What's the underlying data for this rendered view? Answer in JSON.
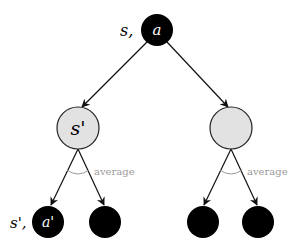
{
  "diagram": {
    "type": "expectimax-tree",
    "colors": {
      "action_node": "#000000",
      "state_node_fill": "#e2e2e2",
      "state_node_stroke": "#222222",
      "edge": "#111111",
      "average_label": "#9a9a9a"
    },
    "root": {
      "prefix_label": "s,",
      "node_label": "a"
    },
    "state_nodes": [
      {
        "label": "s'",
        "average_label": "average"
      },
      {
        "label": "",
        "average_label": "average"
      }
    ],
    "leaf_nodes": [
      {
        "prefix_label": "s',",
        "node_label": "a'"
      },
      {
        "prefix_label": "",
        "node_label": ""
      },
      {
        "prefix_label": "",
        "node_label": ""
      },
      {
        "prefix_label": "",
        "node_label": ""
      }
    ]
  }
}
